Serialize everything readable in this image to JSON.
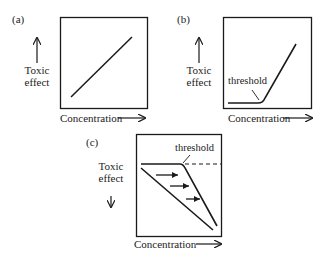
{
  "panels": [
    {
      "id": "a",
      "label": "(a)",
      "y_label_line1": "Toxic",
      "y_label_line2": "effect",
      "y_arrow": "up",
      "x_label": "Concentration",
      "curve": "linear increasing"
    },
    {
      "id": "b",
      "label": "(b)",
      "y_label_line1": "Toxic",
      "y_label_line2": "effect",
      "y_arrow": "up",
      "x_label": "Concentration",
      "annotation": "threshold",
      "curve": "flat then increasing after threshold"
    },
    {
      "id": "c",
      "label": "(c)",
      "y_label_line1": "Toxic",
      "y_label_line2": "effect",
      "y_arrow": "down",
      "x_label": "Concentration",
      "annotation": "threshold",
      "curve": "flat then decreasing after threshold, shift right arrows from linear decreasing curve, dashed continuation"
    }
  ],
  "colors": {
    "line": "#1a1a1a",
    "background": "#ffffff"
  }
}
